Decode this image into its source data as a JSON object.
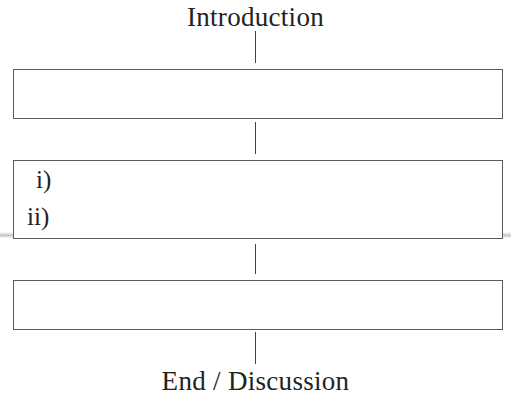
{
  "diagram": {
    "top_label": "Introduction",
    "bottom_label": "End / Discussion",
    "boxes": [
      {
        "id": "box-1",
        "items": []
      },
      {
        "id": "box-2",
        "items": [
          "i)",
          "ii)"
        ]
      },
      {
        "id": "box-3",
        "items": []
      }
    ],
    "colors": {
      "line": "#444444",
      "box_border": "#5a5a5a",
      "text": "#222222"
    }
  }
}
